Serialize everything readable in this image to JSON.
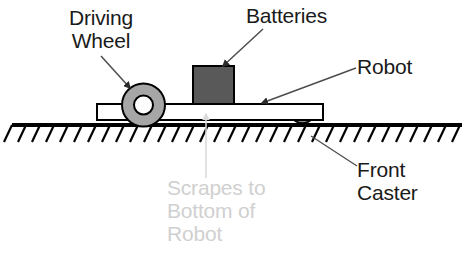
{
  "diagram": {
    "labels": {
      "driving_wheel": "Driving\nWheel",
      "batteries": "Batteries",
      "robot": "Robot",
      "front_caster": "Front\nCaster",
      "scrapes_note": "Scrapes to\nBottom of\nRobot"
    },
    "parts": {
      "driving_wheel": "driving-wheel",
      "batteries_block": "batteries-block",
      "chassis": "robot-chassis-platform",
      "front_caster": "front-caster",
      "ground": "ground-hatched-line"
    },
    "colors": {
      "text": "#1a1a1a",
      "ghost_text": "#d0d0d0",
      "wheel_tire": "#a6a6a6",
      "wheel_hub": "#ffffff",
      "battery_fill": "#595959",
      "chassis_fill": "#ffffff",
      "caster_fill": "#8c8c8c",
      "outline": "#000000",
      "leader_line": "#4d4d4d",
      "ghost_leader": "#d9d9d9"
    }
  }
}
